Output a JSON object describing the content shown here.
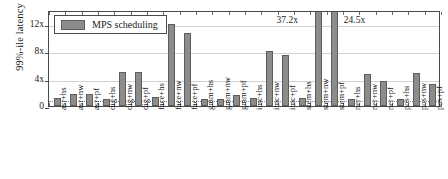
{
  "chart_data": {
    "type": "bar",
    "title": "",
    "xlabel": "",
    "ylabel": "99%-ile latency",
    "ylim": [
      0,
      14
    ],
    "yticks": [
      0,
      4,
      8,
      12
    ],
    "ytick_labels": [
      "0",
      "4x",
      "8x",
      "12x"
    ],
    "grid": true,
    "reference_line": {
      "value": 1,
      "style": "dotted"
    },
    "legend": {
      "position": "top-left",
      "entries": [
        "MPS scheduling"
      ]
    },
    "series_name": "MPS scheduling",
    "bar_color": "#8c8c8c",
    "categories": [
      "asr+hs",
      "asr+nw",
      "asr+pf",
      "dig+hs",
      "dig+nw",
      "dig+pf",
      "face+hs",
      "face+nw",
      "face+pf",
      "gmm+hs",
      "gmm+nw",
      "gmm+pf",
      "imc+hs",
      "imc+nw",
      "imc+pf",
      "stem+hs",
      "stem+nw",
      "stem+pf",
      "ner+hs",
      "ner+nw",
      "ner+pf",
      "pos+hs",
      "pos+nw",
      "pos+pf"
    ],
    "values": [
      1.1,
      1.7,
      1.8,
      1.0,
      5.0,
      5.0,
      1.3,
      11.9,
      10.7,
      1.0,
      1.0,
      1.6,
      1.1,
      8.0,
      7.5,
      1.1,
      37.2,
      24.5,
      1.0,
      4.7,
      3.7,
      1.0,
      4.8,
      3.2
    ],
    "clipped_bars": [
      {
        "category": "stem+nw",
        "label": "37.2x"
      },
      {
        "category": "stem+pf",
        "label": "24.5x"
      }
    ],
    "annotations": [
      "37.2x",
      "24.5x"
    ]
  }
}
